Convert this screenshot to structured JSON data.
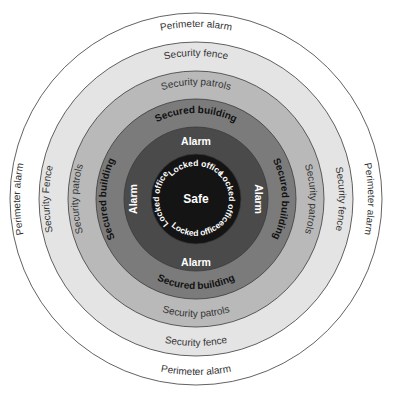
{
  "diagram": {
    "center": {
      "x": 196,
      "y": 199
    },
    "rings": [
      {
        "id": "perimeter",
        "radius": 186,
        "color": "#ffffff",
        "labels": {
          "top": "Perimeter alarm",
          "bottom": "Perimeter alarm",
          "left": "Perimeter alarm",
          "right": "Perimeter alarm"
        }
      },
      {
        "id": "fence",
        "radius": 157,
        "color": "#e4e4e4",
        "labels": {
          "top": "Security fence",
          "bottom": "Security fence",
          "left": "Security Fence",
          "right": "Security fence"
        }
      },
      {
        "id": "patrols",
        "radius": 128,
        "color": "#b9b9b9",
        "labels": {
          "top": "Security patrols",
          "bottom": "Security patrols",
          "left": "Security patrols",
          "right": "Security patrols"
        }
      },
      {
        "id": "building",
        "radius": 100,
        "color": "#7b7b7b",
        "labels": {
          "top": "Secured building",
          "bottom": "Secured building",
          "left": "Secured building",
          "right": "Secured building"
        }
      },
      {
        "id": "alarm",
        "radius": 72,
        "color": "#4a4a4a",
        "labels": {
          "top": "Alarm",
          "bottom": "Alarm",
          "left": "Alarm",
          "right": "Alarm"
        }
      },
      {
        "id": "locked",
        "radius": 45,
        "color": "#141414",
        "labels": {
          "top": "Locked office",
          "bottom": "Locked office",
          "left": "Locked office",
          "right": "Locked office"
        }
      }
    ],
    "core": {
      "label": "Safe"
    }
  }
}
